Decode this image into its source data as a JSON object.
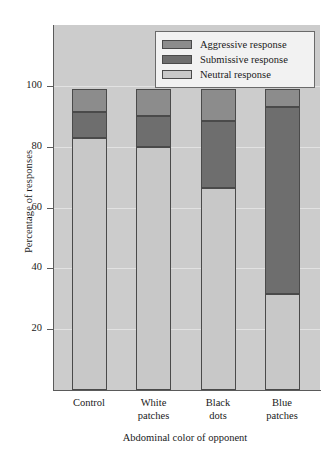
{
  "chart_data": {
    "type": "bar",
    "subtype": "stacked-bar-percent",
    "title": "",
    "xlabel": "Abdominal color of opponent",
    "ylabel": "Percentage of responses",
    "categories": [
      "Control",
      "White patches",
      "Black dots",
      "Blue patches"
    ],
    "category_lines": [
      [
        "Control",
        ""
      ],
      [
        "White",
        "patches"
      ],
      [
        "Black",
        "dots"
      ],
      [
        "Blue",
        "patches"
      ]
    ],
    "series": [
      {
        "name": "Neutral response",
        "values": [
          83.0,
          80.0,
          66.5,
          31.5
        ],
        "color": "#c8c8c8"
      },
      {
        "name": "Submissive response",
        "values": [
          8.5,
          10.0,
          22.0,
          61.5
        ],
        "color": "#6e6e6e"
      },
      {
        "name": "Aggressive response",
        "values": [
          7.5,
          9.0,
          10.5,
          6.0
        ],
        "color": "#8c8c8c"
      }
    ],
    "stack_order_bottom_to_top": [
      "Neutral response",
      "Submissive response",
      "Aggressive response"
    ],
    "ylim": [
      0,
      120
    ],
    "yticks": [
      20,
      40,
      60,
      80,
      100
    ],
    "ytick_labels": [
      "20",
      "40",
      "60",
      "80",
      "100"
    ],
    "grid": true,
    "grid_color": "#e2e2e2",
    "plot_background": "#cccccc",
    "legend_position": "top-right",
    "legend_entries": [
      {
        "label": "Aggressive response",
        "color": "#8c8c8c"
      },
      {
        "label": "Submissive response",
        "color": "#6e6e6e"
      },
      {
        "label": "Neutral response",
        "color": "#c8c8c8"
      }
    ]
  }
}
